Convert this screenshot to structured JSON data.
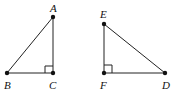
{
  "diagram": {
    "title": "",
    "colors": {
      "stroke": "#222222",
      "point": "#111111",
      "background": "#ffffff"
    },
    "triangles": [
      {
        "name": "ABC",
        "vertices": {
          "A": {
            "label": "A",
            "x": 53,
            "y": 17,
            "lx": 50,
            "ly": 12
          },
          "B": {
            "label": "B",
            "x": 7,
            "y": 73,
            "lx": 4,
            "ly": 89
          },
          "C": {
            "label": "C",
            "x": 53,
            "y": 73,
            "lx": 49,
            "ly": 89
          }
        },
        "right_angle_at": "C"
      },
      {
        "name": "EFD",
        "vertices": {
          "E": {
            "label": "E",
            "x": 104,
            "y": 24,
            "lx": 100,
            "ly": 18
          },
          "F": {
            "label": "F",
            "x": 104,
            "y": 73,
            "lx": 100,
            "ly": 89
          },
          "D": {
            "label": "D",
            "x": 165,
            "y": 73,
            "lx": 162,
            "ly": 89
          }
        },
        "right_angle_at": "F"
      }
    ]
  }
}
